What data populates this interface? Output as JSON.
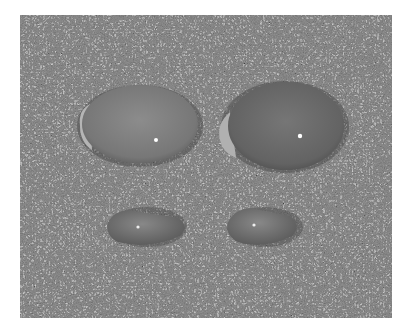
{
  "image": {
    "description": "Grayscale photograph of four cowrie shells resting on coarse speckled sand",
    "subject": "cowrie shells",
    "background": "speckled sand",
    "colors": {
      "page": "#ffffff",
      "sand": "#8e8e8e",
      "shell_large_left": "#7d7d7d",
      "shell_large_right": "#6a6a6a",
      "shell_small": "#7a7a7a",
      "highlight": "#ffffff"
    },
    "shells": [
      {
        "name": "large-left-shell",
        "cx": 140,
        "cy": 124,
        "rx": 62,
        "ry": 40
      },
      {
        "name": "large-right-shell",
        "cx": 284,
        "cy": 125,
        "rx": 63,
        "ry": 45
      },
      {
        "name": "small-left-shell",
        "cx": 147,
        "cy": 227,
        "rx": 39,
        "ry": 19
      },
      {
        "name": "small-right-shell",
        "cx": 265,
        "cy": 227,
        "rx": 37,
        "ry": 19
      }
    ]
  }
}
